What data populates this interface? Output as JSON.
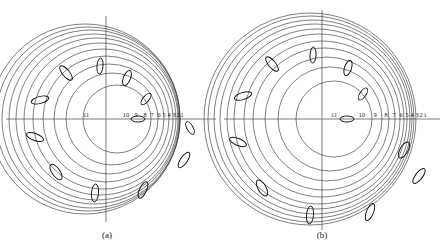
{
  "figure": {
    "background": "#ffffff",
    "width": 446,
    "height": 249,
    "line_color": "#3a3a3a",
    "axis_color": "#6e6e6e",
    "label_color": "#1a1a1a"
  },
  "captions": {
    "panel_a": "(a)",
    "panel_b": "(b)"
  },
  "chart_data": {
    "type": "scatter",
    "title": "",
    "xlabel": "",
    "ylabel": "",
    "grid": false,
    "legend": null,
    "panels": [
      {
        "id": "a",
        "caption": "(a)",
        "center": [
          106,
          119
        ],
        "axis_x_range": [
          6,
          216
        ],
        "axis_y_range": [
          16,
          222
        ],
        "ring_count": 11,
        "ring_labels": [
          "11",
          "10",
          "9",
          "8",
          "7",
          "6",
          "5",
          "4",
          "3",
          "2",
          "1"
        ],
        "ring_label_y": 119,
        "ring_radii": [
          34,
          46,
          55,
          63,
          70,
          76,
          81,
          85,
          89,
          92,
          95
        ],
        "ring_centers_x": [
          117,
          112,
          109,
          106,
          103,
          100,
          97,
          94,
          91,
          88,
          85
        ],
        "ring_label_x": [
          86,
          126,
          136,
          145,
          152,
          159,
          164,
          169,
          174,
          178,
          182
        ],
        "ellipses": [
          {
            "cx": 138,
            "cy": 119,
            "rx": 7,
            "ry": 3,
            "angle": 0
          },
          {
            "cx": 146,
            "cy": 99,
            "rx": 3,
            "ry": 7,
            "angle": 40
          },
          {
            "cx": 127,
            "cy": 78,
            "rx": 3.5,
            "ry": 8,
            "angle": 22
          },
          {
            "cx": 100,
            "cy": 66,
            "rx": 3,
            "ry": 8,
            "angle": 5
          },
          {
            "cx": 66,
            "cy": 73,
            "rx": 3.5,
            "ry": 9,
            "angle": -40
          },
          {
            "cx": 40,
            "cy": 100,
            "rx": 9,
            "ry": 3.5,
            "angle": -15
          },
          {
            "cx": 35,
            "cy": 137,
            "rx": 9,
            "ry": 3.5,
            "angle": 20
          },
          {
            "cx": 56,
            "cy": 172,
            "rx": 4,
            "ry": 9,
            "angle": -35
          },
          {
            "cx": 95,
            "cy": 193,
            "rx": 3.5,
            "ry": 9,
            "angle": 5
          },
          {
            "cx": 143,
            "cy": 190,
            "rx": 3.5,
            "ry": 9,
            "angle": 25
          },
          {
            "cx": 184,
            "cy": 160,
            "rx": 3.5,
            "ry": 9,
            "angle": 35
          },
          {
            "cx": 190,
            "cy": 128,
            "rx": 7,
            "ry": 3,
            "angle": 60
          }
        ]
      },
      {
        "id": "b",
        "caption": "(b)",
        "center": [
          322,
          119
        ],
        "axis_x_range": [
          224,
          440
        ],
        "axis_y_range": [
          10,
          230
        ],
        "ring_count": 11,
        "ring_labels": [
          "11",
          "10",
          "9",
          "8",
          "7",
          "6",
          "5",
          "4",
          "3",
          "2",
          "1"
        ],
        "ring_label_y": 119,
        "ring_radii": [
          38,
          52,
          62,
          71,
          78,
          85,
          90,
          95,
          99,
          103,
          106
        ],
        "ring_centers_x": [
          334,
          330,
          327,
          324,
          322,
          319,
          317,
          315,
          313,
          311,
          310
        ],
        "ring_label_x": [
          334,
          362,
          375,
          386,
          394,
          401,
          407,
          412,
          417,
          421,
          425
        ],
        "ellipses": [
          {
            "cx": 347,
            "cy": 119,
            "rx": 7,
            "ry": 3,
            "angle": 0
          },
          {
            "cx": 363,
            "cy": 94,
            "rx": 3,
            "ry": 7,
            "angle": 35
          },
          {
            "cx": 348,
            "cy": 68,
            "rx": 3.5,
            "ry": 8,
            "angle": 18
          },
          {
            "cx": 313,
            "cy": 55,
            "rx": 3,
            "ry": 8,
            "angle": 3
          },
          {
            "cx": 272,
            "cy": 64,
            "rx": 3.5,
            "ry": 9,
            "angle": -40
          },
          {
            "cx": 243,
            "cy": 96,
            "rx": 9,
            "ry": 3.5,
            "angle": -18
          },
          {
            "cx": 238,
            "cy": 142,
            "rx": 9,
            "ry": 3.5,
            "angle": 22
          },
          {
            "cx": 262,
            "cy": 188,
            "rx": 4,
            "ry": 9,
            "angle": -30
          },
          {
            "cx": 310,
            "cy": 215,
            "rx": 3.5,
            "ry": 9,
            "angle": 5
          },
          {
            "cx": 370,
            "cy": 212,
            "rx": 3.5,
            "ry": 9,
            "angle": 22
          },
          {
            "cx": 419,
            "cy": 176,
            "rx": 3.5,
            "ry": 9,
            "angle": 38
          },
          {
            "cx": 404,
            "cy": 150,
            "rx": 4,
            "ry": 9,
            "angle": 30
          }
        ]
      }
    ]
  }
}
